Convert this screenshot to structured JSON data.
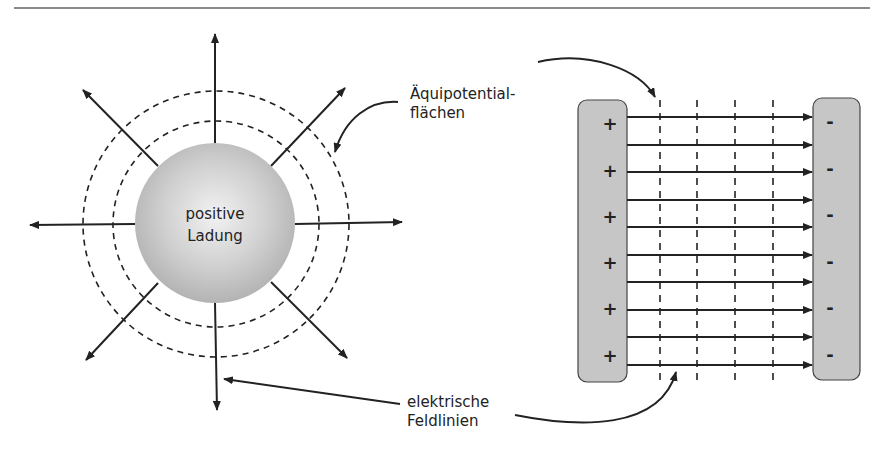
{
  "figure": {
    "left_panel": {
      "charge_label_line1": "positive",
      "charge_label_line2": "Ladung"
    },
    "right_panel": {
      "positive_plate_signs": [
        "+",
        "+",
        "+",
        "+",
        "+",
        "+"
      ],
      "negative_plate_signs": [
        "-",
        "-",
        "-",
        "-",
        "-",
        "-"
      ],
      "field_line_count": 10,
      "equipotential_line_count": 4
    },
    "annotations": {
      "equipotential_line1": "Äquipotential-",
      "equipotential_line2": "flächen",
      "fieldlines_line1": "elektrische",
      "fieldlines_line2": "Feldlinien"
    },
    "colors": {
      "sphere": "#c8c8c8",
      "plate": "#c6c6c6",
      "stroke": "#222222",
      "rule": "#8a8a8a"
    }
  }
}
